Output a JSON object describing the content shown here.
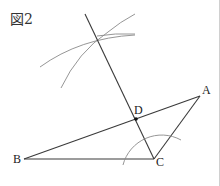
{
  "figure": {
    "label": "図2",
    "points": {
      "A": {
        "label": "A",
        "x": 200,
        "y": 96
      },
      "B": {
        "label": "B",
        "x": 24,
        "y": 159
      },
      "C": {
        "label": "C",
        "x": 154,
        "y": 159
      },
      "D": {
        "label": "D",
        "x": 136,
        "y": 119
      }
    },
    "colors": {
      "line": "#3a3a3a",
      "arc": "#8a8a8a",
      "point": "#111111"
    }
  }
}
